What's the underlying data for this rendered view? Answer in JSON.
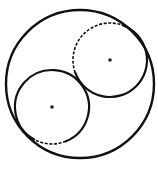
{
  "diagram": {
    "colors": {
      "stroke": "#111111",
      "background": "#ffffff"
    },
    "elements": [
      {
        "id": "outer-circle",
        "kind": "circle",
        "style": "solid"
      },
      {
        "id": "upper-right-circle",
        "kind": "circle",
        "style": "partially-dashed",
        "has_center_dot": true
      },
      {
        "id": "lower-left-circle",
        "kind": "circle",
        "style": "partially-dashed",
        "has_center_dot": true
      }
    ]
  }
}
